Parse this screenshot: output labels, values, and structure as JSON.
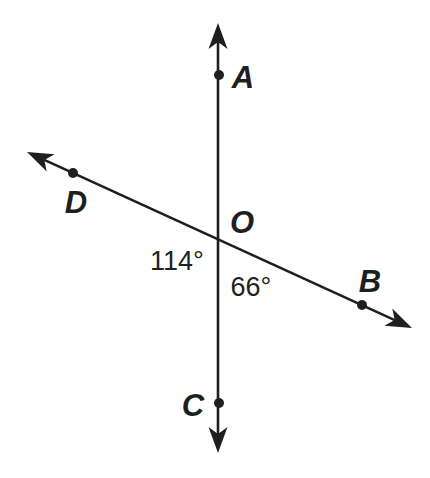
{
  "page": {
    "background": "#ffffff"
  },
  "diagram": {
    "canvas": {
      "width": 430,
      "height": 478
    },
    "ink_color": "#1f1f1f",
    "stroke_width": 2.6,
    "dot_radius": 5,
    "arrow": {
      "length": 26,
      "half_width": 9.5,
      "notch": 19
    },
    "lines": [
      {
        "id": "line-AC",
        "through_points": "A-O-C",
        "tip1": [
          218,
          23
        ],
        "tip2": [
          218,
          453
        ]
      },
      {
        "id": "line-DB",
        "through_points": "D-O-B",
        "tip1": [
          27,
          152
        ],
        "tip2": [
          412,
          328
        ]
      }
    ],
    "intersection": {
      "label": "O",
      "x": 219,
      "y": 240
    },
    "point_label_font_size": 31,
    "points": [
      {
        "label": "A",
        "has_dot": true,
        "dot": [
          219,
          75
        ],
        "label_pos": [
          243,
          88
        ]
      },
      {
        "label": "D",
        "has_dot": true,
        "dot": [
          73,
          173
        ],
        "label_pos": [
          76,
          213
        ]
      },
      {
        "label": "O",
        "has_dot": false,
        "dot": null,
        "label_pos": [
          242,
          233
        ]
      },
      {
        "label": "B",
        "has_dot": true,
        "dot": [
          362,
          305
        ],
        "label_pos": [
          370,
          292
        ]
      },
      {
        "label": "C",
        "has_dot": true,
        "dot": [
          219,
          403
        ],
        "label_pos": [
          193,
          416
        ]
      }
    ],
    "angle_label_font_size": 27,
    "angle_labels": [
      {
        "text": "114°",
        "value_degrees": 114,
        "pos": [
          177,
          270
        ]
      },
      {
        "text": "66°",
        "value_degrees": 66,
        "pos": [
          251,
          296
        ]
      }
    ]
  }
}
